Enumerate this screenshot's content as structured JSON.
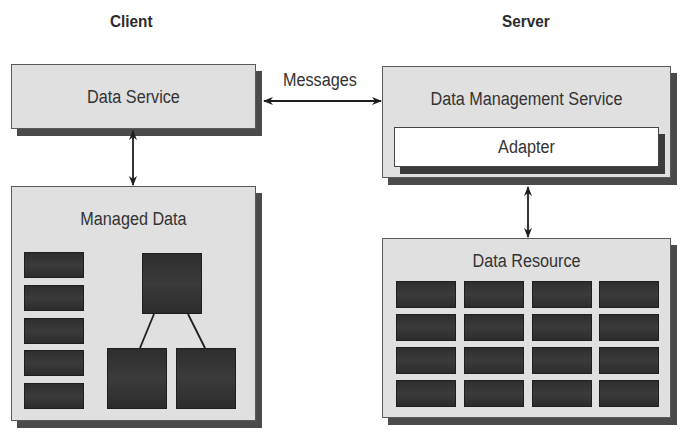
{
  "diagram": {
    "client_title": "Client",
    "server_title": "Server",
    "messages_label": "Messages",
    "data_service": "Data Service",
    "managed_data": "Managed Data",
    "data_management_service": "Data Management Service",
    "adapter": "Adapter",
    "data_resource": "Data Resource"
  },
  "colors": {
    "box_fill": "#e0e0e0",
    "shadow": "#4a4a4a",
    "dark_block": "#333333",
    "adapter_fill": "#ffffff"
  }
}
